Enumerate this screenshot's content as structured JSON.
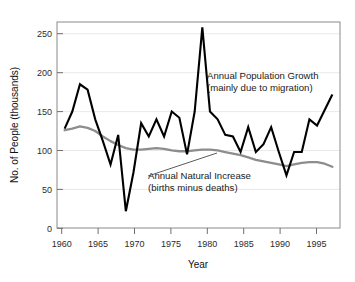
{
  "chart_data": {
    "type": "line",
    "title": "",
    "xlabel": "Year",
    "ylabel": "No. of People (thousands)",
    "xlim": [
      1960,
      1997
    ],
    "ylim": [
      0,
      265
    ],
    "yticks": [
      0,
      50,
      100,
      150,
      200,
      250
    ],
    "xticks": [
      1960,
      1965,
      1970,
      1975,
      1980,
      1985,
      1990,
      1995
    ],
    "grid": "horizontal",
    "legend_position": "inline-annotations",
    "annotations": [
      {
        "name": "annual-population-growth",
        "line1": "Annual Population Growth",
        "line2": "(mainly due to migration)",
        "color": "#000000"
      },
      {
        "name": "annual-natural-increase",
        "line1": "Annual Natural Increase",
        "line2": "(births minus deaths)",
        "color": "#8d8d8d"
      }
    ],
    "series": [
      {
        "name": "Annual Population Growth",
        "color": "#000000",
        "x": [
          1961,
          1962,
          1963,
          1964,
          1965,
          1966,
          1967,
          1968,
          1969,
          1970,
          1971,
          1972,
          1973,
          1974,
          1975,
          1976,
          1977,
          1978,
          1979,
          1980,
          1981,
          1982,
          1983,
          1984,
          1985,
          1986,
          1987,
          1988,
          1989,
          1990,
          1991,
          1992,
          1993,
          1994,
          1995,
          1996
        ],
        "values": [
          128,
          150,
          185,
          178,
          140,
          112,
          82,
          120,
          22,
          72,
          135,
          118,
          140,
          118,
          150,
          142,
          95,
          150,
          258,
          150,
          140,
          120,
          118,
          98,
          130,
          98,
          108,
          130,
          98,
          68,
          98,
          98,
          140,
          132,
          152,
          172
        ]
      },
      {
        "name": "Annual Natural Increase",
        "color": "#8d8d8d",
        "x": [
          1961,
          1962,
          1963,
          1964,
          1965,
          1966,
          1967,
          1968,
          1969,
          1970,
          1971,
          1972,
          1973,
          1974,
          1975,
          1976,
          1977,
          1978,
          1979,
          1980,
          1981,
          1982,
          1983,
          1984,
          1985,
          1986,
          1987,
          1988,
          1989,
          1990,
          1991,
          1992,
          1993,
          1994,
          1995,
          1996
        ],
        "values": [
          126,
          128,
          131,
          129,
          125,
          118,
          112,
          107,
          103,
          101,
          101,
          102,
          103,
          102,
          100,
          99,
          99,
          100,
          101,
          101,
          100,
          98,
          96,
          94,
          91,
          88,
          86,
          84,
          82,
          80,
          82,
          84,
          85,
          85,
          83,
          79
        ]
      }
    ]
  },
  "axes": {
    "y_title": "No. of People (thousands)",
    "x_title": "Year",
    "y_tick_labels": [
      "250",
      "200",
      "150",
      "100",
      "50",
      "0"
    ],
    "x_tick_labels": [
      "1960",
      "1965",
      "1970",
      "1975",
      "1980",
      "1985",
      "1990",
      "1995"
    ]
  }
}
